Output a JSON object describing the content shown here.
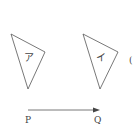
{
  "diagram": {
    "shapes": [
      {
        "label": "ア",
        "points": "11,34 45,52 28,89"
      },
      {
        "label": "イ",
        "points": "83,34 118,52 100,89"
      }
    ],
    "vector": {
      "start_label": "P",
      "end_label": "Q"
    },
    "partial_right_label": "(",
    "colors": {
      "stroke": "#555555",
      "background": "#ffffff"
    }
  }
}
